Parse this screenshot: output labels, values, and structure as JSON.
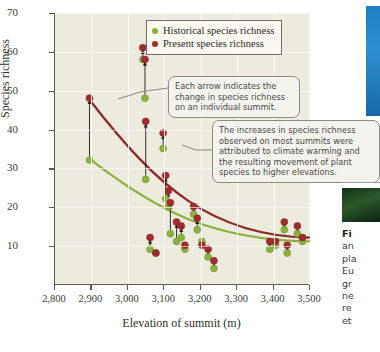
{
  "figure": {
    "axes": {
      "ylabel": "Species richness",
      "xlabel": "Elevation of summit (m)",
      "yticks": [
        "10",
        "20",
        "30",
        "40",
        "50",
        "60",
        "70"
      ],
      "xticks": [
        "2,800",
        "2,900",
        "3,000",
        "3,100",
        "3,200",
        "3,300",
        "3,400",
        "3,500"
      ]
    },
    "legend": {
      "historical_label": "Historical species richness",
      "present_label": "Present species richness",
      "historical_color": "#8cb13e",
      "present_color": "#a32b2b"
    },
    "callouts": {
      "arrow_note": {
        "lines": [
          "Each arrow indicates the",
          "change in species richness",
          "on an individual summit."
        ]
      },
      "increase_note": {
        "lines": [
          "The increases in species richness",
          "observed on most summits were",
          "attributed to climate warming and",
          "the resulting movement of plant",
          "species to higher elevations."
        ]
      }
    }
  },
  "caption": {
    "lead": "Fi",
    "lines": [
      "an",
      "pla",
      "Eu",
      "gr",
      "ne",
      "re",
      "et"
    ]
  },
  "chart_data": {
    "type": "scatter",
    "title": "",
    "xlabel": "Elevation of summit (m)",
    "ylabel": "Species richness",
    "xlim": [
      2800,
      3500
    ],
    "ylim": [
      0,
      70
    ],
    "grid": true,
    "legend_position": "top-right-inside",
    "series": [
      {
        "name": "Historical species richness",
        "color": "#8cb13e",
        "points": [
          {
            "x": 2895,
            "y": 32
          },
          {
            "x": 3042,
            "y": 58
          },
          {
            "x": 3048,
            "y": 48
          },
          {
            "x": 3050,
            "y": 27
          },
          {
            "x": 3062,
            "y": 9
          },
          {
            "x": 3078,
            "y": 8
          },
          {
            "x": 3098,
            "y": 35
          },
          {
            "x": 3105,
            "y": 22
          },
          {
            "x": 3112,
            "y": 20
          },
          {
            "x": 3118,
            "y": 13
          },
          {
            "x": 3135,
            "y": 11
          },
          {
            "x": 3148,
            "y": 12
          },
          {
            "x": 3158,
            "y": 9
          },
          {
            "x": 3182,
            "y": 18
          },
          {
            "x": 3192,
            "y": 14
          },
          {
            "x": 3205,
            "y": 11
          },
          {
            "x": 3222,
            "y": 7
          },
          {
            "x": 3238,
            "y": 4
          },
          {
            "x": 3392,
            "y": 9
          },
          {
            "x": 3408,
            "y": 10
          },
          {
            "x": 3432,
            "y": 14
          },
          {
            "x": 3440,
            "y": 8
          },
          {
            "x": 3468,
            "y": 13
          },
          {
            "x": 3482,
            "y": 11
          }
        ]
      },
      {
        "name": "Present species richness",
        "color": "#a32b2b",
        "points": [
          {
            "x": 2895,
            "y": 48
          },
          {
            "x": 3042,
            "y": 61
          },
          {
            "x": 3048,
            "y": 58
          },
          {
            "x": 3050,
            "y": 42
          },
          {
            "x": 3062,
            "y": 12
          },
          {
            "x": 3078,
            "y": 8
          },
          {
            "x": 3098,
            "y": 39
          },
          {
            "x": 3105,
            "y": 28
          },
          {
            "x": 3112,
            "y": 24
          },
          {
            "x": 3118,
            "y": 21
          },
          {
            "x": 3135,
            "y": 16
          },
          {
            "x": 3148,
            "y": 15
          },
          {
            "x": 3158,
            "y": 10
          },
          {
            "x": 3182,
            "y": 20
          },
          {
            "x": 3192,
            "y": 17
          },
          {
            "x": 3205,
            "y": 10
          },
          {
            "x": 3222,
            "y": 9
          },
          {
            "x": 3238,
            "y": 6
          },
          {
            "x": 3392,
            "y": 11
          },
          {
            "x": 3408,
            "y": 11
          },
          {
            "x": 3432,
            "y": 16
          },
          {
            "x": 3440,
            "y": 10
          },
          {
            "x": 3468,
            "y": 15
          },
          {
            "x": 3482,
            "y": 12
          }
        ]
      }
    ],
    "trend_lines": [
      {
        "name": "Present trend",
        "color": "#8e2626",
        "from": {
          "x": 2900,
          "y": 47
        },
        "to": {
          "x": 3500,
          "y": 12
        }
      },
      {
        "name": "Historical trend",
        "color": "#8cb13e",
        "from": {
          "x": 2900,
          "y": 32
        },
        "to": {
          "x": 3500,
          "y": 11
        }
      }
    ],
    "annotations": [
      "Each arrow indicates the change in species richness on an individual summit.",
      "The increases in species richness observed on most summits were attributed to climate warming and the resulting movement of plant species to higher elevations."
    ]
  }
}
